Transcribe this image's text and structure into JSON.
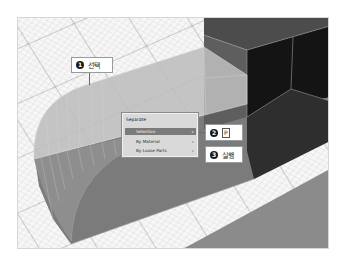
{
  "viewport": {
    "grid_color": "#c9c9c9",
    "grid_major_color": "#777777",
    "selected_object_color": "#b8b8b8",
    "object_side_color": "#808080",
    "cube_front_color": "#141414"
  },
  "context_menu": {
    "title": "Separate",
    "items": [
      {
        "label": "Selection",
        "indicator": "▸",
        "highlighted": true
      },
      {
        "label": "By Material",
        "indicator": "▸",
        "highlighted": false
      },
      {
        "label": "By Loose Parts",
        "indicator": "▸",
        "highlighted": false
      }
    ]
  },
  "callouts": [
    {
      "number": "1",
      "text": "선택"
    },
    {
      "number": "2",
      "key": "P"
    },
    {
      "number": "3",
      "text": "실행"
    }
  ]
}
